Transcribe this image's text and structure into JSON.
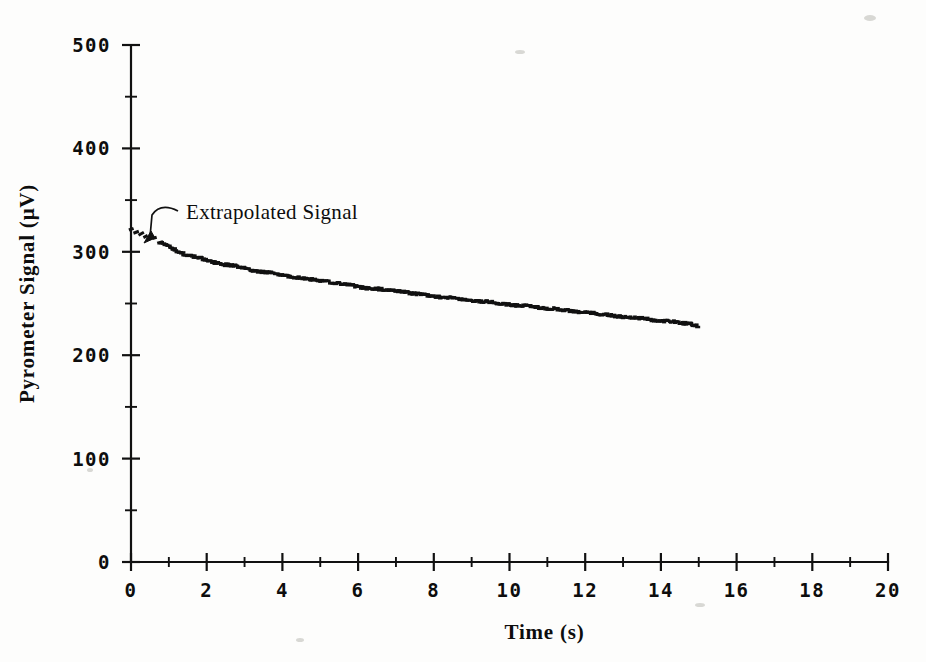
{
  "figure": {
    "background_color": "#fdfdfc",
    "ink_color": "#111111"
  },
  "annotations": [
    {
      "name": "extrapolated-signal",
      "text": "Extrapolated Signal",
      "x_text": 186,
      "y_text": 219,
      "arrow_to_x": 144,
      "arrow_to_y": 243
    }
  ],
  "chart_data": {
    "type": "scatter",
    "title": "",
    "subtitle": "",
    "xlabel": "Time (s)",
    "ylabel": "Pyrometer Signal (μV)",
    "xlim": [
      0,
      20
    ],
    "ylim": [
      0,
      500
    ],
    "grid": false,
    "legend": "none",
    "x_major_ticks": [
      0,
      2,
      4,
      6,
      8,
      10,
      12,
      14,
      16,
      18,
      20
    ],
    "x_tick_labels": [
      "0",
      "2",
      "4",
      "6",
      "8",
      "10",
      "12",
      "14",
      "16",
      "18",
      "20"
    ],
    "x_minor_step": 1,
    "y_major_ticks": [
      0,
      100,
      200,
      300,
      400,
      500
    ],
    "y_tick_labels": [
      "0",
      "100",
      "200",
      "300",
      "400",
      "500"
    ],
    "y_minor_step": 50,
    "series": [
      {
        "name": "Extrapolated Signal",
        "style": "dotted-extrapolation",
        "x": [
          0.0,
          0.12,
          0.25,
          0.38,
          0.5,
          0.62,
          0.75
        ],
        "values": [
          322,
          320,
          318,
          316,
          314,
          312,
          310
        ]
      },
      {
        "name": "Pyrometer Signal",
        "style": "dotted-trace",
        "x": [
          0.8,
          1.0,
          1.2,
          1.4,
          1.6,
          1.8,
          2.0,
          2.2,
          2.4,
          2.6,
          2.8,
          3.0,
          3.2,
          3.4,
          3.6,
          3.8,
          4.0,
          4.2,
          4.4,
          4.6,
          4.8,
          5.0,
          5.2,
          5.4,
          5.6,
          5.8,
          6.0,
          6.2,
          6.4,
          6.6,
          6.8,
          7.0,
          7.2,
          7.4,
          7.6,
          7.8,
          8.0,
          8.2,
          8.4,
          8.6,
          8.8,
          9.0,
          9.2,
          9.4,
          9.6,
          9.8,
          10.0,
          10.2,
          10.4,
          10.6,
          10.8,
          11.0,
          11.2,
          11.4,
          11.6,
          11.8,
          12.0,
          12.2,
          12.4,
          12.6,
          12.8,
          13.0,
          13.2,
          13.4,
          13.6,
          13.8,
          14.0,
          14.2,
          14.4,
          14.6,
          14.8,
          15.0
        ],
        "values": [
          309,
          305,
          301,
          298,
          296,
          294,
          292,
          290,
          288,
          287,
          286,
          284,
          282,
          281,
          280,
          279,
          277,
          276,
          275,
          274,
          273,
          272,
          271,
          270,
          269,
          268,
          266,
          265,
          264,
          264,
          263,
          262,
          261,
          260,
          259,
          258,
          257,
          256,
          256,
          255,
          254,
          253,
          252,
          252,
          251,
          250,
          249,
          248,
          248,
          247,
          246,
          245,
          245,
          244,
          243,
          242,
          241,
          241,
          240,
          239,
          238,
          237,
          236,
          236,
          235,
          234,
          233,
          233,
          232,
          231,
          230,
          228
        ]
      }
    ]
  }
}
